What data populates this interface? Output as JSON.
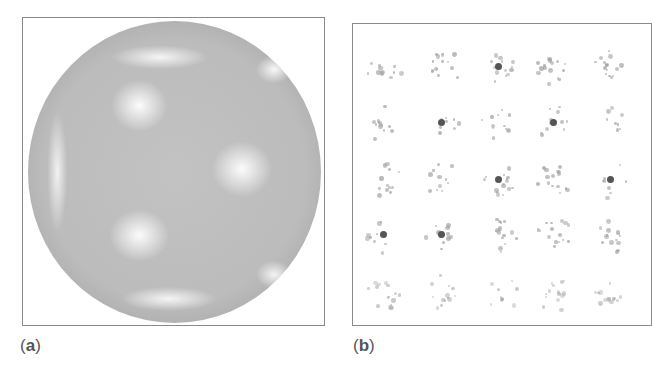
{
  "figure": {
    "panels": [
      {
        "id": "a",
        "label_open": "(",
        "label_letter": "a",
        "label_close": ")",
        "content": "sphere-intensity-map"
      },
      {
        "id": "b",
        "label_open": "(",
        "label_letter": "b",
        "label_close": ")",
        "content": "pattern-grid-5x5"
      }
    ],
    "grid": {
      "rows": 5,
      "cols": 5
    }
  },
  "colors": {
    "border": "#8a8a8a",
    "caption": "#555555",
    "sphere_base": "#bcbcbc"
  }
}
